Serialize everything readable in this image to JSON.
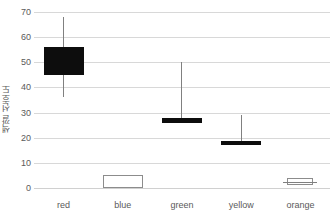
{
  "chart_data": {
    "type": "box",
    "title": "",
    "xlabel": "",
    "ylabel": "색깔 선호도",
    "ylim": [
      0,
      70
    ],
    "ytick_labels": [
      "0",
      "10",
      "20",
      "30",
      "40",
      "50",
      "60",
      "70"
    ],
    "ytick_values": [
      0,
      10,
      20,
      30,
      40,
      50,
      60,
      70
    ],
    "grid": true,
    "legend": "none",
    "categories": [
      "red",
      "blue",
      "green",
      "yellow",
      "orange"
    ],
    "boxes": [
      {
        "category": "red",
        "whisker_low": 36,
        "q1": 45,
        "median": 51,
        "q3": 56,
        "whisker_high": 68,
        "fill": "#0d0d0d",
        "style": "filled",
        "show_whiskers": true,
        "show_median": false
      },
      {
        "category": "blue",
        "whisker_low": 0,
        "q1": 0,
        "median": 2,
        "q3": 5,
        "whisker_high": 5,
        "fill": "#ffffff",
        "style": "open",
        "show_whiskers": false,
        "show_median": false
      },
      {
        "category": "green",
        "whisker_low": 26,
        "q1": 26,
        "median": 27,
        "q3": 28,
        "whisker_high": 50,
        "fill": "#0d0d0d",
        "style": "filled",
        "show_whiskers": true,
        "show_median": false
      },
      {
        "category": "yellow",
        "whisker_low": 17,
        "q1": 17,
        "median": 18,
        "q3": 18.5,
        "whisker_high": 29,
        "fill": "#0d0d0d",
        "style": "filled",
        "show_whiskers": true,
        "show_median": false
      },
      {
        "category": "orange",
        "whisker_low": 1,
        "q1": 1,
        "median": 2.5,
        "q3": 4,
        "whisker_high": 4,
        "fill": "#ffffff",
        "style": "open",
        "show_whiskers": false,
        "show_median": true
      }
    ],
    "colors": {
      "gridline": "#d8d8d8",
      "tick_text": "#5a5a5a",
      "box_fill_dark": "#0d0d0d",
      "box_fill_light": "#ffffff",
      "box_stroke_light": "#8c8c8c",
      "whisker": "#808080",
      "background": "#ffffff"
    }
  }
}
